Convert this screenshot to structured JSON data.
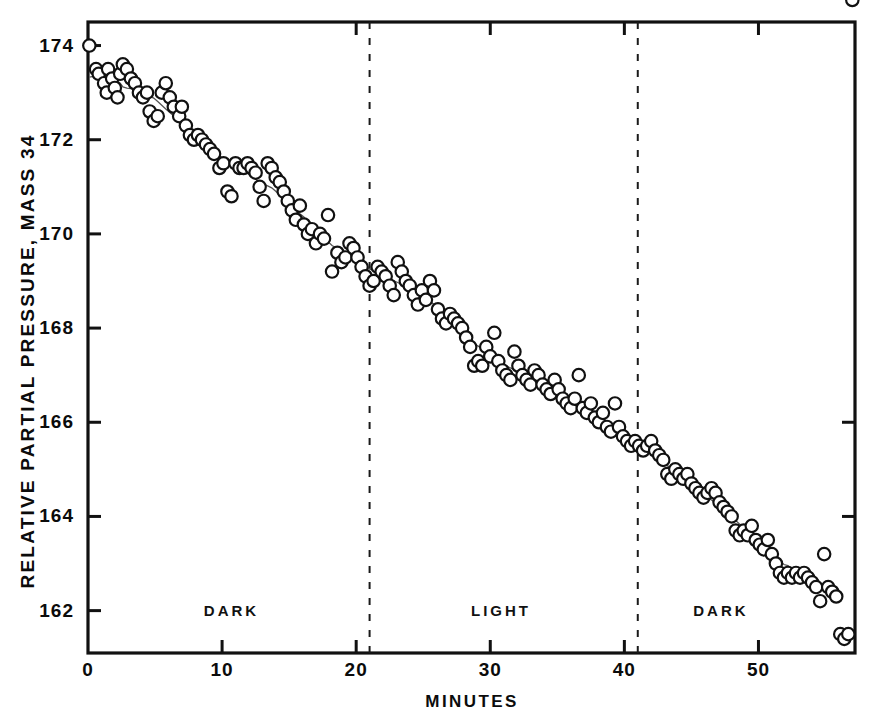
{
  "chart_data": {
    "type": "scatter",
    "title": "",
    "xlabel": "MINUTES",
    "ylabel": "RELATIVE PARTIAL PRESSURE, MASS 34",
    "xlim": [
      0,
      57.2
    ],
    "ylim": [
      161.1,
      174.5
    ],
    "xticks": [
      0,
      10,
      20,
      30,
      40,
      50
    ],
    "xtick_labels": [
      "0",
      "10",
      "20",
      "30",
      "40",
      "50"
    ],
    "yticks": [
      162,
      164,
      166,
      168,
      170,
      172,
      174
    ],
    "ytick_labels": [
      "162",
      "164",
      "166",
      "168",
      "170",
      "172",
      "174"
    ],
    "grid": false,
    "legend": null,
    "marker": "open-circle",
    "marker_color": "#111111",
    "line_color": "#555555",
    "connecting_line": true,
    "annotations": [
      {
        "text": "DARK",
        "x": 10.7,
        "y": 162.0
      },
      {
        "text": "LIGHT",
        "x": 30.8,
        "y": 162.0
      },
      {
        "text": "DARK",
        "x": 47.2,
        "y": 162.0
      }
    ],
    "vlines": [
      {
        "x": 21.0,
        "style": "dashed",
        "label": "dark-to-light transition"
      },
      {
        "x": 41.0,
        "style": "dashed",
        "label": "light-to-dark transition"
      }
    ],
    "x": [
      0.1,
      0.6,
      0.8,
      1.2,
      1.4,
      1.5,
      1.8,
      2.0,
      2.2,
      2.4,
      2.6,
      2.9,
      3.2,
      3.5,
      3.8,
      4.1,
      4.4,
      4.6,
      4.9,
      5.2,
      5.5,
      5.8,
      6.1,
      6.4,
      6.8,
      7.0,
      7.3,
      7.6,
      7.9,
      8.2,
      8.5,
      8.8,
      9.1,
      9.4,
      9.8,
      10.1,
      10.4,
      10.7,
      11.0,
      11.3,
      11.6,
      11.9,
      12.2,
      12.5,
      12.8,
      13.1,
      13.4,
      13.7,
      14.0,
      14.3,
      14.6,
      14.9,
      15.2,
      15.5,
      15.8,
      16.1,
      16.4,
      16.7,
      17.0,
      17.3,
      17.6,
      17.9,
      18.2,
      18.6,
      18.9,
      19.2,
      19.5,
      19.8,
      20.1,
      20.4,
      20.7,
      21.0,
      21.3,
      21.6,
      21.9,
      22.2,
      22.5,
      22.8,
      23.1,
      23.4,
      23.7,
      24.0,
      24.3,
      24.6,
      24.9,
      25.2,
      25.5,
      25.8,
      26.1,
      26.4,
      26.7,
      27.0,
      27.3,
      27.6,
      27.9,
      28.2,
      28.5,
      28.8,
      29.1,
      29.4,
      29.7,
      30.0,
      30.3,
      30.6,
      30.9,
      31.2,
      31.5,
      31.8,
      32.1,
      32.4,
      32.7,
      33.0,
      33.3,
      33.6,
      33.9,
      34.2,
      34.5,
      34.8,
      35.1,
      35.4,
      35.7,
      36.0,
      36.3,
      36.6,
      36.9,
      37.2,
      37.5,
      37.8,
      38.1,
      38.4,
      38.7,
      39.0,
      39.3,
      39.6,
      39.9,
      40.2,
      40.5,
      40.8,
      41.1,
      41.4,
      41.7,
      42.0,
      42.3,
      42.6,
      42.9,
      43.2,
      43.5,
      43.8,
      44.1,
      44.4,
      44.7,
      45.0,
      45.3,
      45.6,
      45.9,
      46.2,
      46.5,
      46.8,
      47.1,
      47.4,
      47.7,
      48.0,
      48.3,
      48.6,
      48.9,
      49.2,
      49.5,
      49.8,
      50.1,
      50.4,
      50.7,
      51.0,
      51.3,
      51.6,
      51.9,
      52.2,
      52.5,
      52.8,
      53.1,
      53.4,
      53.7,
      54.0,
      54.3,
      54.6,
      54.9,
      55.2,
      55.5,
      55.8,
      56.1,
      56.4,
      56.7,
      57.0
    ],
    "y": [
      174.0,
      173.5,
      173.4,
      173.2,
      173.0,
      173.5,
      173.3,
      173.1,
      172.9,
      173.4,
      173.6,
      173.5,
      173.3,
      173.2,
      173.0,
      172.9,
      173.0,
      172.6,
      172.4,
      172.5,
      173.0,
      173.2,
      172.9,
      172.7,
      172.5,
      172.7,
      172.3,
      172.1,
      172.0,
      172.1,
      172.0,
      171.9,
      171.8,
      171.7,
      171.4,
      171.5,
      170.9,
      170.8,
      171.5,
      171.4,
      171.4,
      171.5,
      171.4,
      171.3,
      171.0,
      170.7,
      171.5,
      171.4,
      171.2,
      171.1,
      170.9,
      170.7,
      170.5,
      170.3,
      170.6,
      170.2,
      170.0,
      170.1,
      169.8,
      170.0,
      169.9,
      170.4,
      169.2,
      169.6,
      169.4,
      169.5,
      169.8,
      169.7,
      169.5,
      169.3,
      169.1,
      168.9,
      169.0,
      169.3,
      169.2,
      169.1,
      168.9,
      168.7,
      169.4,
      169.2,
      169.0,
      168.9,
      168.7,
      168.5,
      168.8,
      168.6,
      169.0,
      168.8,
      168.4,
      168.2,
      168.1,
      168.3,
      168.2,
      168.1,
      168.0,
      167.8,
      167.6,
      167.2,
      167.3,
      167.2,
      167.6,
      167.4,
      167.9,
      167.3,
      167.1,
      167.0,
      166.9,
      167.5,
      167.2,
      167.0,
      166.9,
      166.8,
      167.1,
      167.0,
      166.8,
      166.7,
      166.6,
      166.9,
      166.7,
      166.5,
      166.4,
      166.3,
      166.5,
      167.0,
      166.3,
      166.2,
      166.4,
      166.1,
      166.0,
      166.2,
      165.9,
      165.8,
      166.4,
      165.9,
      165.7,
      165.6,
      165.5,
      165.6,
      165.5,
      165.4,
      165.5,
      165.6,
      165.4,
      165.3,
      165.2,
      164.9,
      164.8,
      165.0,
      164.9,
      164.8,
      164.9,
      164.7,
      164.6,
      164.5,
      164.4,
      164.5,
      164.6,
      164.5,
      164.3,
      164.2,
      164.1,
      164.0,
      163.7,
      163.6,
      163.7,
      163.6,
      163.8,
      163.5,
      163.4,
      163.3,
      163.5,
      163.2,
      163.0,
      162.8,
      162.7,
      162.8,
      162.7,
      162.8,
      162.7,
      162.8,
      162.7,
      162.6,
      162.5,
      162.2,
      163.2,
      162.5,
      162.4,
      162.3,
      161.5,
      161.4,
      161.5
    ]
  },
  "axis": {
    "x_title": "MINUTES",
    "y_title": "RELATIVE PARTIAL PRESSURE, MASS 34"
  }
}
